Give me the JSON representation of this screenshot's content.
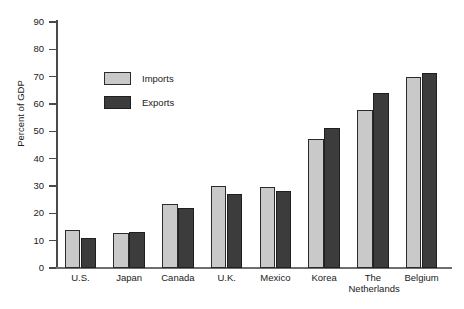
{
  "chart_data": {
    "type": "bar",
    "title": "",
    "subtitle": "",
    "xlabel": "",
    "ylabel": "Percent of GDP",
    "ylim": [
      0,
      90
    ],
    "yticks": [
      0,
      10,
      20,
      30,
      40,
      50,
      60,
      70,
      80,
      90
    ],
    "grid": false,
    "legend_position": "upper-left-inside",
    "categories": [
      "U.S.",
      "Japan",
      "Canada",
      "U.K.",
      "Mexico",
      "Korea",
      "The\nNetherlands",
      "Belgium"
    ],
    "series": [
      {
        "name": "Imports",
        "color": "#c9c9c9",
        "values": [
          13.8,
          12.8,
          23.3,
          30.0,
          29.5,
          47.2,
          57.8,
          69.8
        ]
      },
      {
        "name": "Exports",
        "color": "#3c3c3c",
        "values": [
          11.0,
          13.2,
          22.0,
          27.0,
          28.2,
          51.2,
          64.0,
          71.2
        ]
      }
    ]
  },
  "axis": {
    "y_label": "Percent of GDP",
    "y_tick_labels": [
      "0",
      "10",
      "20",
      "30",
      "40",
      "50",
      "60",
      "70",
      "80",
      "90"
    ]
  },
  "legend": {
    "items": [
      {
        "label": "Imports",
        "swatch": "imports"
      },
      {
        "label": "Exports",
        "swatch": "exports"
      }
    ]
  },
  "colors": {
    "imports": "#c9c9c9",
    "exports": "#3c3c3c",
    "axis": "#4a4a4a",
    "background": "#ffffff"
  }
}
